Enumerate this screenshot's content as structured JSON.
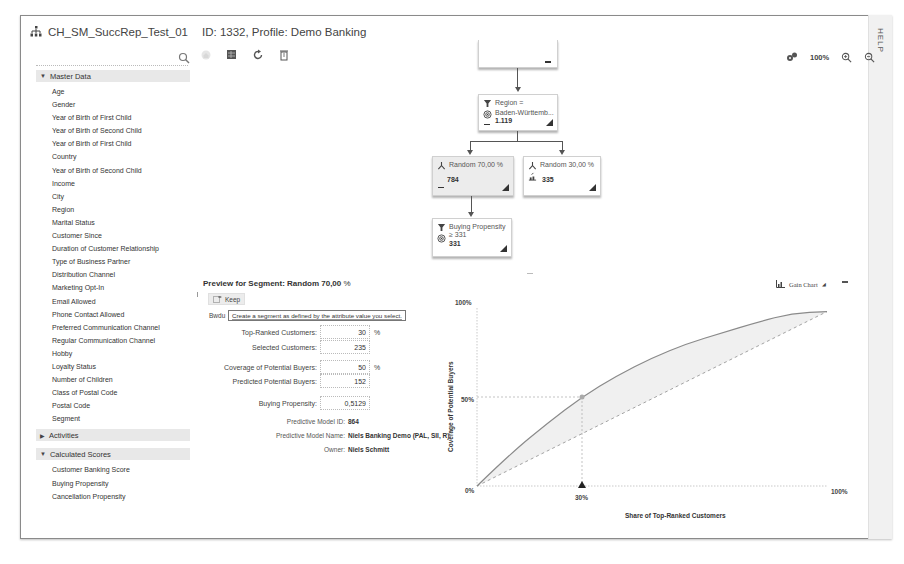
{
  "window": {
    "title": "CH_SM_SuccRep_Test_01",
    "subtitle": "ID: 1332, Profile: Demo Banking",
    "help_label": "HELP"
  },
  "sidebar": {
    "search": {
      "placeholder": "",
      "value": ""
    },
    "groups": [
      {
        "label": "Master Data",
        "expanded": true,
        "items": [
          "Age",
          "Gender",
          "Year of Birth of First Child",
          "Year of Birth of Second Child",
          "Year of Birth of First Child",
          "Country",
          "Year of Birth of Second Child",
          "Income",
          "City",
          "Region",
          "Marital Status",
          "Customer Since",
          "Duration of Customer Relationship",
          "Type of Business Partner",
          "Distribution Channel",
          "Marketing Opt-In",
          "Email Allowed",
          "Phone Contact Allowed",
          "Preferred Communication Channel",
          "Regular Communication Channel",
          "Hobby",
          "Loyalty Status",
          "Number of Children",
          "Class of Postal Code",
          "Postal Code",
          "Segment"
        ]
      },
      {
        "label": "Activities",
        "expanded": false,
        "items": []
      },
      {
        "label": "Calculated Scores",
        "expanded": true,
        "items": [
          "Customer Banking Score",
          "Buying Propensity",
          "Cancellation Propensity"
        ]
      }
    ]
  },
  "toolbar": {
    "icons": [
      "home-icon",
      "segment-icon",
      "refresh-icon",
      "delete-icon"
    ]
  },
  "zoom": {
    "level": "100%"
  },
  "tree": {
    "nodes": [
      {
        "id": "region",
        "line1": "Region =",
        "line2": "Baden-Württemb...",
        "count": "1.119"
      },
      {
        "id": "random70",
        "line1": "Random 70,00 %",
        "line2": "",
        "count": "784",
        "selected": true
      },
      {
        "id": "random30",
        "line1": "Random 30,00 %",
        "line2": "",
        "count": "335"
      },
      {
        "id": "buying",
        "line1": "Buying Propensity",
        "line2": "≥ 331",
        "count": "331"
      }
    ]
  },
  "preview": {
    "title": "Preview for Segment: Random 70,00",
    "title_suffix": "%",
    "keep_label": "Keep",
    "cut_label": "Bwdu",
    "tooltip": "Create a segment as defined by the attribute value you select.",
    "fields": [
      {
        "label": "Top-Ranked Customers:",
        "value": "30",
        "unit": "%"
      },
      {
        "label": "Selected Customers:",
        "value": "235",
        "unit": ""
      },
      {
        "label": "Coverage of Potential Buyers:",
        "value": "50",
        "unit": "%"
      },
      {
        "label": "Predicted Potential Buyers:",
        "value": "152",
        "unit": ""
      },
      {
        "label": "Buying Propensity:",
        "value": "0,5129",
        "unit": ""
      }
    ],
    "info": [
      {
        "label": "Predictive Model ID:",
        "value": "864"
      },
      {
        "label": "Predictive Model Name:",
        "value": "Niels Banking Demo (PAL, SII, R)"
      },
      {
        "label": "Owner:",
        "value": "Niels Schmitt"
      }
    ]
  },
  "chart_header": {
    "label": "Gain Chart"
  },
  "chart_data": {
    "type": "line",
    "title": "Gain Chart",
    "xlabel": "Share of Top-Ranked Customers",
    "ylabel": "Coverage of Potential Buyers",
    "x_ticks": [
      "0%",
      "30%",
      "100%"
    ],
    "y_ticks": [
      "0%",
      "50%",
      "100%"
    ],
    "xlim": [
      0,
      100
    ],
    "ylim": [
      0,
      100
    ],
    "grid": false,
    "series": [
      {
        "name": "Model gain",
        "style": "solid",
        "x": [
          0,
          10,
          20,
          30,
          40,
          50,
          60,
          70,
          80,
          90,
          100
        ],
        "values": [
          0,
          19,
          35,
          50,
          62,
          72,
          80,
          86,
          92,
          97,
          98
        ]
      },
      {
        "name": "Random",
        "style": "dashed",
        "x": [
          0,
          100
        ],
        "values": [
          0,
          98
        ]
      }
    ],
    "marker": {
      "x": 30,
      "y": 50
    }
  }
}
